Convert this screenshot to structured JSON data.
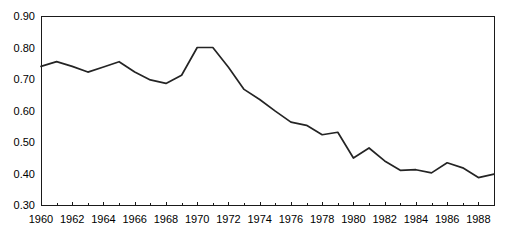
{
  "chart_data": {
    "type": "line",
    "title": "",
    "subtitle": "",
    "xlabel": "",
    "ylabel": "",
    "xlim": [
      1960,
      1989
    ],
    "ylim": [
      0.3,
      0.9
    ],
    "grid": false,
    "legend": null,
    "legend_position": "none",
    "y_ticks": [
      0.3,
      0.4,
      0.5,
      0.6,
      0.7,
      0.8,
      0.9
    ],
    "y_tick_labels": [
      "0.30",
      "0.40",
      "0.50",
      "0.60",
      "0.70",
      "0.80",
      "0.90"
    ],
    "x_ticks_major": [
      1960,
      1962,
      1964,
      1966,
      1968,
      1970,
      1972,
      1974,
      1976,
      1978,
      1980,
      1982,
      1984,
      1986,
      1988
    ],
    "x_tick_labels": [
      "1960",
      "1962",
      "1964",
      "1966",
      "1968",
      "1970",
      "1972",
      "1974",
      "1976",
      "1978",
      "1980",
      "1982",
      "1984",
      "1986",
      "1988"
    ],
    "x_ticks_minor": [
      1961,
      1963,
      1965,
      1967,
      1969,
      1971,
      1973,
      1975,
      1977,
      1979,
      1981,
      1983,
      1985,
      1987,
      1989
    ],
    "x": [
      1960,
      1961,
      1962,
      1963,
      1964,
      1965,
      1966,
      1967,
      1968,
      1969,
      1970,
      1971,
      1972,
      1973,
      1974,
      1975,
      1976,
      1977,
      1978,
      1979,
      1980,
      1981,
      1982,
      1983,
      1984,
      1985,
      1986,
      1987,
      1988,
      1989
    ],
    "values": [
      0.74,
      0.755,
      0.74,
      0.722,
      0.738,
      0.755,
      0.722,
      0.697,
      0.686,
      0.712,
      0.8,
      0.8,
      0.737,
      0.667,
      0.635,
      0.598,
      0.563,
      0.553,
      0.523,
      0.531,
      0.449,
      0.481,
      0.44,
      0.41,
      0.412,
      0.402,
      0.434,
      0.418,
      0.387,
      0.398
    ],
    "series": [
      {
        "name": "series-1",
        "color": "#242424",
        "values": [
          0.74,
          0.755,
          0.74,
          0.722,
          0.738,
          0.755,
          0.722,
          0.697,
          0.686,
          0.712,
          0.8,
          0.8,
          0.737,
          0.667,
          0.635,
          0.598,
          0.563,
          0.553,
          0.523,
          0.531,
          0.449,
          0.481,
          0.44,
          0.41,
          0.412,
          0.402,
          0.434,
          0.418,
          0.387,
          0.398
        ]
      }
    ],
    "axis_color": "#1a1a1a",
    "line_color": "#242424",
    "background_color": "#ffffff"
  },
  "plot": {
    "left": 41,
    "right": 494,
    "top": 16,
    "bottom": 205
  }
}
